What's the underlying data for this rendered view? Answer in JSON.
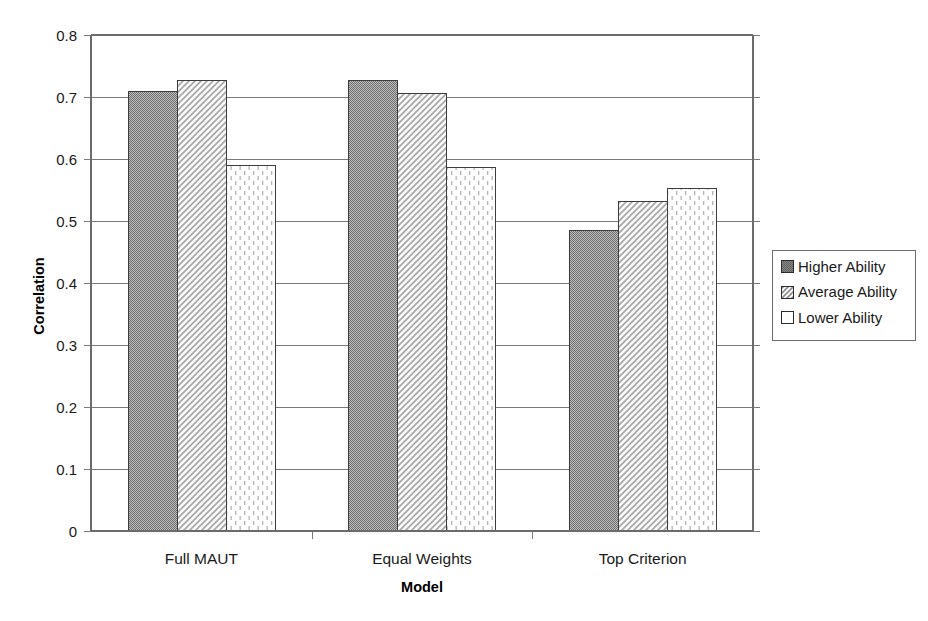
{
  "chart_data": {
    "type": "bar",
    "title": "",
    "xlabel": "Model",
    "ylabel": "Correlation",
    "categories": [
      "Full MAUT",
      "Equal Weights",
      "Top Criterion"
    ],
    "series": [
      {
        "name": "Higher Ability",
        "values": [
          0.71,
          0.727,
          0.485
        ],
        "pattern": "solid-dark-gray",
        "color": "#808080"
      },
      {
        "name": "Average Ability",
        "values": [
          0.728,
          0.706,
          0.533
        ],
        "pattern": "diagonal-hatch",
        "color": "#f2f2f2"
      },
      {
        "name": "Lower Ability",
        "values": [
          0.59,
          0.587,
          0.553
        ],
        "pattern": "vertical-stipple",
        "color": "#fdfdfd"
      }
    ],
    "ylim": [
      0,
      0.8
    ],
    "ytick_step": 0.1,
    "ytick_labels": [
      "0",
      "0.1",
      "0.2",
      "0.3",
      "0.4",
      "0.5",
      "0.6",
      "0.7",
      "0.8"
    ],
    "grid": true,
    "legend_position": "right"
  },
  "legend": {
    "items": [
      {
        "label": "Higher Ability"
      },
      {
        "label": "Average Ability"
      },
      {
        "label": "Lower Ability"
      }
    ]
  },
  "axes": {
    "y_title": "Correlation",
    "x_title": "Model"
  }
}
